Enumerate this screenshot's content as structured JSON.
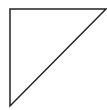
{
  "diagram": {
    "shape": "right-triangle",
    "fill": "#ffffff",
    "stroke": "#222222",
    "stroke_width": 1.5,
    "vertices": [
      {
        "name": "top-left",
        "x": 10,
        "y": 9
      },
      {
        "name": "top-right",
        "x": 106,
        "y": 9
      },
      {
        "name": "bottom-left",
        "x": 10,
        "y": 106
      }
    ]
  }
}
